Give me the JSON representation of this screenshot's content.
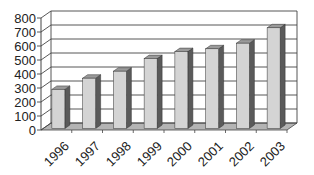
{
  "chart_data": {
    "type": "bar",
    "style": "3d-column",
    "title": "",
    "xlabel": "",
    "ylabel": "",
    "categories": [
      "1996",
      "1997",
      "1998",
      "1999",
      "2000",
      "2001",
      "2002",
      "2003"
    ],
    "values": [
      290,
      370,
      420,
      510,
      560,
      580,
      620,
      730
    ],
    "ylim": [
      0,
      800
    ],
    "yticks": [
      0,
      100,
      200,
      300,
      400,
      500,
      600,
      700,
      800
    ],
    "ytick_labels": [
      "0",
      "100",
      "200",
      "300",
      "400",
      "500",
      "600",
      "700",
      "800"
    ],
    "grid": true,
    "legend": null,
    "colors": {
      "bar_front": "#d4d4d4",
      "bar_side": "#5a5a5a",
      "bar_top": "#9a9a9a",
      "floor": "#b4b4b4",
      "grid": "#444444",
      "axis": "#444444"
    }
  }
}
